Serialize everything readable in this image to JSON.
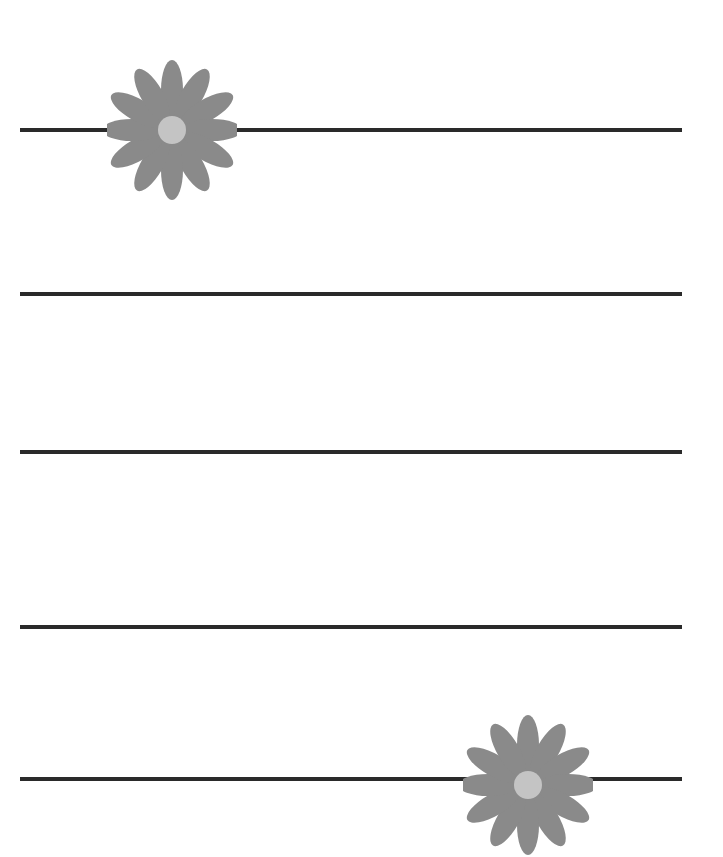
{
  "page": {
    "background": "#ffffff",
    "line_color": "#2a2a2a",
    "petal_color": "#8a8a8a",
    "center_color": "#c4c4c4"
  },
  "lines": [
    {
      "y": 128
    },
    {
      "y": 292
    },
    {
      "y": 450
    },
    {
      "y": 625
    },
    {
      "y": 778
    }
  ],
  "decorations": [
    {
      "icon": "flower-icon",
      "cx": 172,
      "cy": 130
    },
    {
      "icon": "flower-icon",
      "cx": 528,
      "cy": 785
    }
  ]
}
